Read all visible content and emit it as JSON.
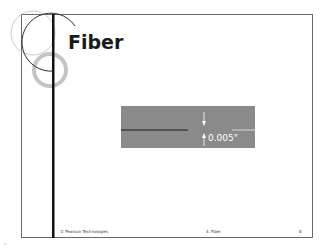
{
  "slide": {
    "title": "Fiber",
    "figure": {
      "dimension_label": "0.005\"",
      "background_color": "#8a8a8a",
      "fiber_line_color": "#1a1a1a",
      "cladding_line_color": "#ffffff"
    },
    "footer": {
      "copyright": "© Pearson Technologies",
      "section": "4. Fiber",
      "page_number": "8"
    }
  },
  "corner_mark": "\""
}
